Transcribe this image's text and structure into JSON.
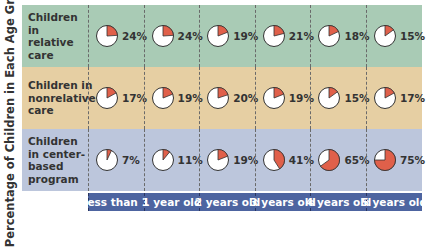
{
  "chart_data": {
    "type": "pie",
    "title": "",
    "ylabel": "Percentage of Children in Each Age Group*",
    "xlabel": "",
    "categories": [
      "less than 1",
      "1 year old",
      "2 years old",
      "3 years old",
      "4 years old",
      "5 years old"
    ],
    "series": [
      {
        "name": "Children in relative care",
        "color": "#a9cbb5",
        "values": [
          24,
          24,
          19,
          21,
          18,
          15
        ]
      },
      {
        "name": "Children in nonrelative care",
        "color": "#e6cfa3",
        "values": [
          17,
          19,
          20,
          19,
          15,
          17
        ]
      },
      {
        "name": "Children in center-based program",
        "color": "#bcc6dc",
        "values": [
          7,
          11,
          19,
          41,
          65,
          75
        ]
      }
    ],
    "pie_fill_color": "#e0604a",
    "axis_band_color": "#4d64a0"
  },
  "ylabel": "Percentage of Children in Each Age Group*",
  "rows": [
    {
      "label": "Children in relative care",
      "cells": [
        "24%",
        "24%",
        "19%",
        "21%",
        "18%",
        "15%"
      ]
    },
    {
      "label": "Children in nonrelative care",
      "cells": [
        "17%",
        "19%",
        "20%",
        "19%",
        "15%",
        "17%"
      ]
    },
    {
      "label": "Children in center-based program",
      "cells": [
        "7%",
        "11%",
        "19%",
        "41%",
        "65%",
        "75%"
      ]
    }
  ],
  "ticks": [
    "less than 1",
    "1 year old",
    "2 years old",
    "3 years old",
    "4 years old",
    "5 years old"
  ]
}
